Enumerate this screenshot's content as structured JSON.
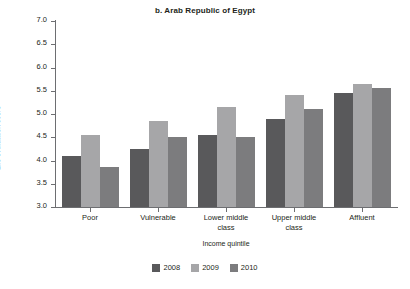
{
  "chart_data": {
    "type": "bar",
    "title": "b. Arab Republic of Egypt",
    "xlabel": "Income quintile",
    "ylabel": "Life evaluation score",
    "ylim": [
      3.0,
      7.0
    ],
    "ytick_step": 0.5,
    "yticks": [
      "7.0",
      "6.5",
      "6.0",
      "5.5",
      "5.0",
      "4.5",
      "4.0",
      "3.5",
      "3.0"
    ],
    "grid": false,
    "legend_position": "bottom-center",
    "categories": [
      "Poor",
      "Vulnerable",
      "Lower middle class",
      "Upper middle class",
      "Affluent"
    ],
    "category_lines": [
      [
        "Poor"
      ],
      [
        "Vulnerable"
      ],
      [
        "Lower middle",
        "class"
      ],
      [
        "Upper middle",
        "class"
      ],
      [
        "Affluent"
      ]
    ],
    "series": [
      {
        "name": "2008",
        "color": "#59595b",
        "values": [
          4.1,
          4.25,
          4.55,
          4.9,
          5.45
        ]
      },
      {
        "name": "2009",
        "color": "#a6a6a8",
        "values": [
          4.55,
          4.85,
          5.15,
          5.4,
          5.65
        ]
      },
      {
        "name": "2010",
        "color": "#7c7c7e",
        "values": [
          3.85,
          4.5,
          4.5,
          5.1,
          5.55
        ]
      }
    ]
  }
}
